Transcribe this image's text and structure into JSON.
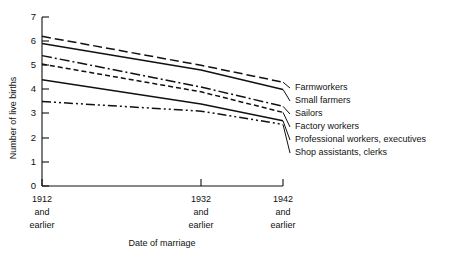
{
  "chart_data": {
    "type": "line",
    "title": "",
    "xlabel": "Date of marriage",
    "ylabel": "Number of live births",
    "ylim": [
      0,
      7
    ],
    "yticks": [
      0,
      1,
      2,
      3,
      4,
      5,
      6,
      7
    ],
    "grid": false,
    "legend_position": "right-inline",
    "categories": [
      "1912 and earlier",
      "1932 and earlier",
      "1942 and earlier"
    ],
    "x_tick_lines": [
      [
        "1912",
        "and",
        "earlier"
      ],
      [
        "1932",
        "and",
        "earlier"
      ],
      [
        "1942",
        "and",
        "earlier"
      ]
    ],
    "series": [
      {
        "name": "Farmworkers",
        "values": [
          6.2,
          5.0,
          4.3
        ],
        "style": "dashed"
      },
      {
        "name": "Small farmers",
        "values": [
          5.9,
          4.8,
          4.0
        ],
        "style": "solid"
      },
      {
        "name": "Sailors",
        "values": [
          5.4,
          4.1,
          3.3
        ],
        "style": "dash-dot"
      },
      {
        "name": "Factory workers",
        "values": [
          5.05,
          3.9,
          3.05
        ],
        "style": "short-dashed"
      },
      {
        "name": "Professional workers, executives",
        "values": [
          4.4,
          3.4,
          2.7
        ],
        "style": "solid"
      },
      {
        "name": "Shop assistants, clerks",
        "values": [
          3.5,
          3.1,
          2.55
        ],
        "style": "dash-dot-dot"
      }
    ]
  },
  "axis": {
    "y_label": "Number of live births",
    "x_label": "Date of marriage",
    "y_tick_0": "0",
    "y_tick_1": "1",
    "y_tick_2": "2",
    "y_tick_3": "3",
    "y_tick_4": "4",
    "y_tick_5": "5",
    "y_tick_6": "6",
    "y_tick_7": "7"
  },
  "xcats": {
    "c0_l0": "1912",
    "c0_l1": "and",
    "c0_l2": "earlier",
    "c1_l0": "1932",
    "c1_l1": "and",
    "c1_l2": "earlier",
    "c2_l0": "1942",
    "c2_l1": "and",
    "c2_l2": "earlier"
  },
  "legend": {
    "s0": "Farmworkers",
    "s1": "Small farmers",
    "s2": "Sailors",
    "s3": "Factory workers",
    "s4": "Professional workers, executives",
    "s5": "Shop assistants, clerks"
  },
  "colors": {
    "ink": "#111111",
    "background": "#ffffff"
  }
}
